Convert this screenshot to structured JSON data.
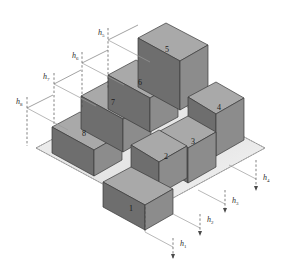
{
  "figure": {
    "type": "isometric-3d-block-diagram",
    "background_color": "#ffffff"
  },
  "palette": {
    "base_plane_fill": "#eeeeee",
    "base_plane_stroke": "#8a8a8a",
    "box_top_fill": "#a9a9a9",
    "box_front_fill": "#6e6e6e",
    "box_side_fill": "#8c8c8c",
    "box_stroke": "#3a3a3a",
    "dash_stroke": "#4a4a4a",
    "leader_stroke": "#7a7a7a",
    "label_color": "#2b2b2b",
    "number_color": "#1a1a1a"
  },
  "boxes": [
    {
      "id": "box-1",
      "number": "1",
      "height_label": "h1",
      "label_x": 131,
      "label_y": 211
    },
    {
      "id": "box-2",
      "number": "2",
      "height_label": "h2",
      "label_x": 166,
      "label_y": 159
    },
    {
      "id": "box-3",
      "number": "3",
      "height_label": "h3",
      "label_x": 193,
      "label_y": 144
    },
    {
      "id": "box-4",
      "number": "4",
      "height_label": "h4",
      "label_x": 219,
      "label_y": 110
    },
    {
      "id": "box-5",
      "number": "5",
      "height_label": "h5",
      "label_x": 167,
      "label_y": 52
    },
    {
      "id": "box-6",
      "number": "6",
      "height_label": "h6",
      "label_x": 140,
      "label_y": 85
    },
    {
      "id": "box-7",
      "number": "7",
      "height_label": "h7",
      "label_x": 113,
      "label_y": 105
    },
    {
      "id": "box-8",
      "number": "8",
      "height_label": "h8",
      "label_x": 84,
      "label_y": 136
    }
  ],
  "height_markers": [
    {
      "id": "h1",
      "base": "h",
      "sub": "1",
      "x": 180,
      "y": 246,
      "side": "right"
    },
    {
      "id": "h2",
      "base": "h",
      "sub": "2",
      "x": 207,
      "y": 222,
      "side": "right"
    },
    {
      "id": "h3",
      "base": "h",
      "sub": "3",
      "x": 232,
      "y": 203,
      "side": "right"
    },
    {
      "id": "h4",
      "base": "h",
      "sub": "4",
      "x": 263,
      "y": 180,
      "side": "right"
    },
    {
      "id": "h5",
      "base": "h",
      "sub": "5",
      "x": 98,
      "y": 35,
      "side": "left"
    },
    {
      "id": "h6",
      "base": "h",
      "sub": "6",
      "x": 72,
      "y": 58,
      "side": "left"
    },
    {
      "id": "h7",
      "base": "h",
      "sub": "7",
      "x": 43,
      "y": 79,
      "side": "left"
    },
    {
      "id": "h8",
      "base": "h",
      "sub": "8",
      "x": 16,
      "y": 104,
      "side": "left"
    }
  ]
}
